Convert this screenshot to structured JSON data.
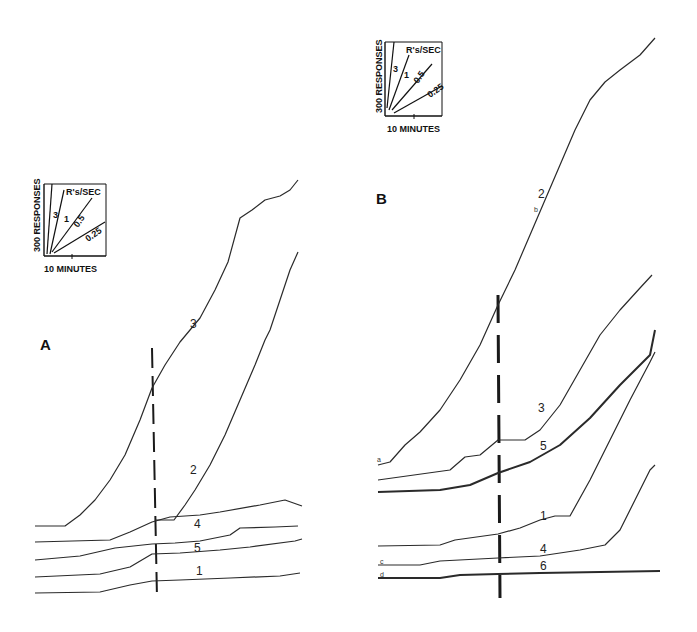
{
  "chart_data": [
    {
      "type": "line",
      "panel": "A",
      "title": "A",
      "xlabel": "Time",
      "ylabel": "Cumulative responses",
      "scale_key": {
        "x_label": "10 MINUTES",
        "y_label": "300 RESPONSES",
        "rate_label": "R's/SEC",
        "rates": [
          "3",
          "1",
          "0.5",
          "0.25"
        ]
      },
      "marker_x": 152,
      "series": [
        {
          "name": "3",
          "label_pos": [
            190,
            328
          ],
          "points": [
            [
              35,
              526
            ],
            [
              65,
              526
            ],
            [
              80,
              515
            ],
            [
              95,
              500
            ],
            [
              110,
              480
            ],
            [
              125,
              455
            ],
            [
              140,
              420
            ],
            [
              152,
              388
            ],
            [
              165,
              365
            ],
            [
              180,
              342
            ],
            [
              200,
              318
            ],
            [
              215,
              290
            ],
            [
              228,
              262
            ],
            [
              240,
              218
            ],
            [
              252,
              210
            ],
            [
              265,
              200
            ],
            [
              280,
              196
            ],
            [
              290,
              190
            ],
            [
              298,
              180
            ]
          ]
        },
        {
          "name": "2",
          "label_pos": [
            190,
            474
          ],
          "points": [
            [
              155,
              520
            ],
            [
              174,
              520
            ],
            [
              185,
              505
            ],
            [
              195,
              490
            ],
            [
              210,
              465
            ],
            [
              225,
              435
            ],
            [
              240,
              400
            ],
            [
              255,
              365
            ],
            [
              265,
              340
            ],
            [
              270,
              330
            ],
            [
              280,
              300
            ],
            [
              290,
              270
            ],
            [
              298,
              252
            ]
          ]
        },
        {
          "name": "4",
          "label_pos": [
            194,
            528
          ],
          "points": [
            [
              35,
              542
            ],
            [
              110,
              540
            ],
            [
              130,
              532
            ],
            [
              152,
              522
            ],
            [
              170,
              517
            ],
            [
              200,
              515
            ],
            [
              220,
              512
            ],
            [
              260,
              505
            ],
            [
              285,
              500
            ],
            [
              302,
              506
            ]
          ]
        },
        {
          "name": "5",
          "label_pos": [
            194,
            552
          ],
          "points": [
            [
              35,
              560
            ],
            [
              80,
              556
            ],
            [
              115,
              548
            ],
            [
              152,
              544
            ],
            [
              175,
              543
            ],
            [
              200,
              541
            ],
            [
              230,
              535
            ],
            [
              240,
              528
            ],
            [
              275,
              527
            ],
            [
              298,
              526
            ]
          ]
        },
        {
          "name": "1",
          "label_pos": [
            196,
            575
          ],
          "points": [
            [
              35,
              577
            ],
            [
              100,
              574
            ],
            [
              130,
              567
            ],
            [
              152,
              554
            ],
            [
              180,
              553
            ],
            [
              220,
              550
            ],
            [
              250,
              547
            ],
            [
              295,
              541
            ],
            [
              302,
              539
            ]
          ]
        },
        {
          "name": "baseline",
          "label_pos": null,
          "points": [
            [
              35,
              593
            ],
            [
              100,
              592
            ],
            [
              130,
              585
            ],
            [
              152,
              581
            ],
            [
              180,
              580
            ],
            [
              230,
              578
            ],
            [
              280,
              576
            ],
            [
              300,
              573
            ]
          ]
        }
      ]
    },
    {
      "type": "line",
      "panel": "B",
      "title": "B",
      "xlabel": "Time",
      "ylabel": "Cumulative responses",
      "scale_key": {
        "x_label": "10 MINUTES",
        "y_label": "300 RESPONSES",
        "rate_label": "R's/SEC",
        "rates": [
          "3",
          "1",
          "0.5",
          "0.25"
        ]
      },
      "marker_x": 498,
      "series": [
        {
          "name": "2",
          "label_pos": [
            538,
            198
          ],
          "points": [
            [
              378,
              465
            ],
            [
              390,
              462
            ],
            [
              405,
              445
            ],
            [
              420,
              432
            ],
            [
              440,
              410
            ],
            [
              460,
              380
            ],
            [
              480,
              345
            ],
            [
              498,
              305
            ],
            [
              515,
              270
            ],
            [
              530,
              235
            ],
            [
              545,
              200
            ],
            [
              560,
              165
            ],
            [
              575,
              130
            ],
            [
              590,
              100
            ],
            [
              605,
              82
            ],
            [
              620,
              70
            ],
            [
              640,
              55
            ],
            [
              655,
              38
            ]
          ]
        },
        {
          "name": "3",
          "label_pos": [
            538,
            412
          ],
          "points": [
            [
              378,
              480
            ],
            [
              450,
              470
            ],
            [
              465,
              457
            ],
            [
              480,
              455
            ],
            [
              498,
              440
            ],
            [
              525,
              440
            ],
            [
              540,
              430
            ],
            [
              560,
              405
            ],
            [
              580,
              370
            ],
            [
              600,
              335
            ],
            [
              620,
              310
            ],
            [
              640,
              288
            ],
            [
              652,
              275
            ]
          ]
        },
        {
          "name": "5",
          "label_pos": [
            540,
            450
          ],
          "points": [
            [
              378,
              492
            ],
            [
              440,
              490
            ],
            [
              470,
              485
            ],
            [
              498,
              473
            ],
            [
              530,
              462
            ],
            [
              560,
              445
            ],
            [
              590,
              418
            ],
            [
              620,
              385
            ],
            [
              650,
              355
            ],
            [
              655,
              330
            ]
          ]
        },
        {
          "name": "1",
          "label_pos": [
            540,
            520
          ],
          "points": [
            [
              378,
              546
            ],
            [
              440,
              545
            ],
            [
              455,
              540
            ],
            [
              498,
              534
            ],
            [
              520,
              528
            ],
            [
              540,
              520
            ],
            [
              555,
              516
            ],
            [
              570,
              516
            ],
            [
              590,
              480
            ],
            [
              610,
              440
            ],
            [
              630,
              400
            ],
            [
              650,
              362
            ],
            [
              655,
              352
            ]
          ]
        },
        {
          "name": "4",
          "label_pos": [
            540,
            553
          ],
          "points": [
            [
              378,
              565
            ],
            [
              420,
              565
            ],
            [
              440,
              561
            ],
            [
              498,
              558
            ],
            [
              540,
              556
            ],
            [
              580,
              550
            ],
            [
              605,
              545
            ],
            [
              620,
              530
            ],
            [
              635,
              500
            ],
            [
              650,
              470
            ],
            [
              655,
              465
            ]
          ]
        },
        {
          "name": "6",
          "label_pos": [
            540,
            570
          ],
          "points": [
            [
              378,
              578
            ],
            [
              440,
              578
            ],
            [
              460,
              575
            ],
            [
              498,
              574
            ],
            [
              540,
              573
            ],
            [
              600,
              572
            ],
            [
              660,
              571
            ]
          ]
        }
      ]
    }
  ],
  "figure": {
    "panel_a_label": "A",
    "panel_b_label": "B",
    "key_a": {
      "y_label": "300 RESPONSES",
      "x_label": "10 MINUTES",
      "rate_label": "R's/SEC",
      "rates": [
        "3",
        "1",
        "0.5",
        "0.25"
      ]
    },
    "key_b": {
      "y_label": "300 RESPONSES",
      "x_label": "10 MINUTES",
      "rate_label": "R's/SEC",
      "rates": [
        "3",
        "1",
        "0.5",
        "0.25"
      ]
    },
    "small_letters_b": [
      "a",
      "b",
      "c",
      "d"
    ]
  }
}
